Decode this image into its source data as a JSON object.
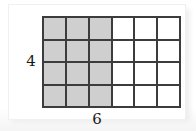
{
  "figure": {
    "card_background": "#ffffff",
    "page_background": "#fdfdfd"
  },
  "labels": {
    "height_label": "4",
    "width_label": "6"
  },
  "chart_data": {
    "type": "heatmap",
    "title": "",
    "subtitle": "",
    "xlabel": "6",
    "ylabel": "4",
    "columns": 6,
    "rows": 4,
    "total_cells": 24,
    "shaded_cells": 12,
    "shaded_columns": 3,
    "shaded_rows": 4,
    "fraction_shaded": "12/24",
    "colors": {
      "shaded": "#cfcfcf",
      "unshaded": "#ffffff",
      "gridline": "#3c3c3c"
    },
    "grid": true,
    "legend": "none",
    "cells": [
      [
        1,
        1,
        1,
        0,
        0,
        0
      ],
      [
        1,
        1,
        1,
        0,
        0,
        0
      ],
      [
        1,
        1,
        1,
        0,
        0,
        0
      ],
      [
        1,
        1,
        1,
        0,
        0,
        0
      ]
    ],
    "x": [
      1,
      2,
      3,
      4,
      5,
      6
    ],
    "y": [
      1,
      2,
      3,
      4
    ],
    "xlim": [
      0,
      6
    ],
    "ylim": [
      0,
      4
    ]
  }
}
